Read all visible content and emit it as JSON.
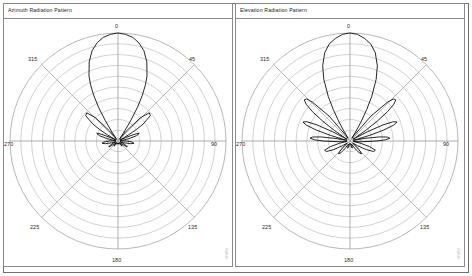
{
  "figure": {
    "panel_count": 2,
    "background_color": "#ffffff",
    "frame_color": "#6f6f6f"
  },
  "panels": [
    {
      "id": "azimuth",
      "title": "Azimuth Radiation Pattern",
      "watermark": "MW01",
      "angle_labels": {
        "top": "0",
        "upper_right": "45",
        "right": "90",
        "lower_right": "135",
        "bottom": "180",
        "lower_left": "225",
        "left": "270",
        "upper_left": "315"
      }
    },
    {
      "id": "elevation",
      "title": "Elevation Radiation Pattern",
      "watermark": "MW02",
      "angle_labels": {
        "top": "0",
        "upper_right": "45",
        "right": "90",
        "lower_right": "135",
        "bottom": "180",
        "lower_left": "225",
        "left": "270",
        "upper_left": "315"
      }
    }
  ],
  "chart_data": [
    {
      "type": "line",
      "subtype": "polar-radiation-pattern",
      "title": "Azimuth Radiation Pattern",
      "xlabel": "",
      "ylabel": "",
      "grid": true,
      "legend": false,
      "angle_unit": "degrees",
      "angle_zero_at": "top",
      "angle_direction": "clockwise",
      "radial_rings": 10,
      "angular_spokes": 8,
      "angular_tick_labels": [
        "0",
        "45",
        "90",
        "135",
        "180",
        "225",
        "270",
        "315"
      ],
      "radial_range": [
        0,
        1
      ],
      "series": [
        {
          "name": "Azimuth gain",
          "description": "Main lobe at 0 degrees, pair of first sidelobes near +/-35 degrees, several small sidelobes toward +/-60 to +/-130 degrees, deep nulls toward rear.",
          "angles": [
            0,
            4,
            8,
            12,
            16,
            20,
            24,
            26,
            28,
            30,
            32,
            34,
            36,
            38,
            40,
            44,
            48,
            52,
            56,
            58,
            60,
            62,
            64,
            66,
            68,
            70,
            74,
            78,
            82,
            86,
            90,
            94,
            98,
            102,
            106,
            110,
            114,
            118,
            122,
            126,
            130,
            134,
            138,
            142,
            146,
            150,
            154,
            158,
            162,
            166,
            170,
            174,
            178,
            180
          ],
          "values": [
            1.0,
            0.99,
            0.97,
            0.93,
            0.87,
            0.78,
            0.66,
            0.58,
            0.48,
            0.36,
            0.22,
            0.1,
            0.03,
            0.02,
            0.12,
            0.3,
            0.39,
            0.38,
            0.28,
            0.2,
            0.11,
            0.04,
            0.02,
            0.09,
            0.17,
            0.21,
            0.18,
            0.1,
            0.03,
            0.02,
            0.08,
            0.13,
            0.15,
            0.12,
            0.06,
            0.02,
            0.04,
            0.08,
            0.1,
            0.07,
            0.03,
            0.02,
            0.04,
            0.06,
            0.05,
            0.03,
            0.02,
            0.02,
            0.03,
            0.03,
            0.02,
            0.02,
            0.02,
            0.02
          ],
          "mirrored": true,
          "color": "#000000"
        }
      ]
    },
    {
      "type": "line",
      "subtype": "polar-radiation-pattern",
      "title": "Elevation Radiation Pattern",
      "xlabel": "",
      "ylabel": "",
      "grid": true,
      "legend": false,
      "angle_unit": "degrees",
      "angle_zero_at": "top",
      "angle_direction": "clockwise",
      "radial_rings": 10,
      "angular_spokes": 8,
      "angular_tick_labels": [
        "0",
        "45",
        "90",
        "135",
        "180",
        "225",
        "270",
        "315"
      ],
      "radial_range": [
        0,
        1
      ],
      "series": [
        {
          "name": "Elevation gain",
          "description": "Main lobe at 0 degrees with a narrow pinched base, plus a fan of large progressively smaller sidelobes stepping out to near +/-90 degrees on both sides.",
          "angles": [
            0,
            4,
            8,
            12,
            16,
            20,
            23,
            26,
            28,
            30,
            32,
            34,
            36,
            40,
            44,
            46,
            48,
            50,
            52,
            54,
            56,
            58,
            60,
            62,
            64,
            66,
            68,
            70,
            72,
            74,
            76,
            78,
            80,
            82,
            84,
            86,
            88,
            90,
            94,
            98,
            102,
            106,
            110,
            114,
            118,
            122,
            126,
            130,
            134,
            138,
            142,
            146,
            150,
            154,
            158,
            162,
            166,
            170,
            174,
            178,
            180
          ],
          "values": [
            1.0,
            0.99,
            0.96,
            0.92,
            0.85,
            0.74,
            0.62,
            0.46,
            0.33,
            0.2,
            0.09,
            0.03,
            0.06,
            0.3,
            0.5,
            0.56,
            0.57,
            0.53,
            0.44,
            0.31,
            0.17,
            0.06,
            0.03,
            0.18,
            0.34,
            0.44,
            0.47,
            0.43,
            0.33,
            0.19,
            0.07,
            0.03,
            0.14,
            0.27,
            0.35,
            0.37,
            0.33,
            0.25,
            0.1,
            0.03,
            0.1,
            0.19,
            0.25,
            0.24,
            0.17,
            0.08,
            0.03,
            0.06,
            0.12,
            0.16,
            0.14,
            0.09,
            0.04,
            0.03,
            0.05,
            0.07,
            0.06,
            0.04,
            0.03,
            0.02,
            0.02
          ],
          "mirrored": true,
          "color": "#000000"
        }
      ]
    }
  ]
}
